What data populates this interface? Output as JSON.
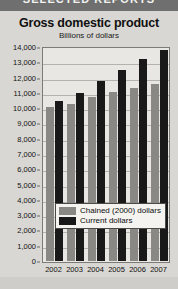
{
  "banner": {
    "text": "SELECTED REPORTS"
  },
  "figure": {
    "title": "Gross domestic product",
    "subtitle": "Billions of dollars"
  },
  "chart_data": {
    "type": "bar",
    "title": "Gross domestic product",
    "subtitle": "Billions of dollars",
    "xlabel": "",
    "ylabel": "Billions of dollars",
    "ylim": [
      0,
      14000
    ],
    "ytick_step": 1000,
    "grid": true,
    "legend_position": "inside-bottom-left",
    "categories": [
      "2002",
      "2003",
      "2004",
      "2005",
      "2006",
      "2007"
    ],
    "ytick_labels": [
      "14,000",
      "13,000",
      "12,000",
      "11,000",
      "10,000",
      "9,000",
      "8,000",
      "7,000",
      "6,000",
      "5,000",
      "4,000",
      "3,000",
      "2,000",
      "1,000",
      "0"
    ],
    "series": [
      {
        "name": "Chained (2000) dollars",
        "color": "#8a8884",
        "values": [
          10050,
          10300,
          10700,
          11050,
          11300,
          11550
        ]
      },
      {
        "name": "Current dollars",
        "color": "#191919",
        "values": [
          10500,
          11000,
          11800,
          12500,
          13200,
          13800
        ]
      }
    ]
  },
  "legend": {
    "items": [
      {
        "label": "Chained (2000) dollars",
        "color": "#8a8884"
      },
      {
        "label": "Current dollars",
        "color": "#191919"
      }
    ]
  },
  "axis": {
    "zero_label": "0"
  }
}
